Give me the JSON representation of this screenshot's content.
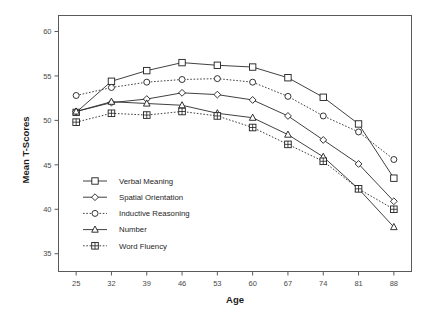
{
  "chart_data": {
    "type": "line",
    "title": "",
    "xlabel": "Age",
    "ylabel": "Mean T-Scores",
    "x": [
      25,
      32,
      39,
      46,
      53,
      60,
      67,
      74,
      81,
      88
    ],
    "xticklabels": [
      "25",
      "32",
      "39",
      "46",
      "53",
      "60",
      "67",
      "74",
      "81",
      "88"
    ],
    "yticklabels": [
      "35",
      "40",
      "45",
      "50",
      "55",
      "60"
    ],
    "yticks": [
      35,
      40,
      45,
      50,
      55,
      60
    ],
    "xlim": [
      21.5,
      91.5
    ],
    "ylim": [
      33.0,
      61.8
    ],
    "grid": false,
    "legend_position": "lower left inside axes",
    "series": [
      {
        "name": "Verbal Meaning",
        "marker": "square",
        "linestyle": "solid",
        "values": [
          50.9,
          54.4,
          55.6,
          56.5,
          56.2,
          56.0,
          54.8,
          52.6,
          49.6,
          43.5
        ]
      },
      {
        "name": "Spatial Orientation",
        "marker": "diamond",
        "linestyle": "solid",
        "values": [
          51.0,
          52.0,
          52.4,
          53.1,
          52.9,
          52.3,
          50.5,
          47.8,
          45.1,
          40.9
        ]
      },
      {
        "name": "Inductive Reasoning",
        "marker": "circle",
        "linestyle": "dotted",
        "values": [
          52.8,
          53.7,
          54.3,
          54.6,
          54.7,
          54.3,
          52.7,
          50.5,
          48.7,
          45.6
        ]
      },
      {
        "name": "Number",
        "marker": "triangle",
        "linestyle": "solid",
        "values": [
          51.0,
          52.1,
          51.9,
          51.7,
          50.8,
          50.3,
          48.4,
          45.9,
          42.3,
          38.0
        ]
      },
      {
        "name": "Word Fluency",
        "marker": "crossed-square",
        "linestyle": "dotted",
        "values": [
          49.8,
          50.8,
          50.6,
          51.0,
          50.5,
          49.2,
          47.3,
          45.4,
          42.3,
          40.0
        ]
      }
    ]
  }
}
